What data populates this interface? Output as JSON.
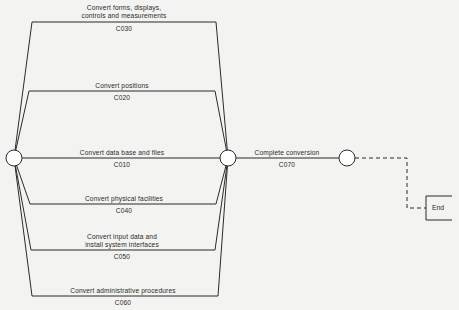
{
  "diagram": {
    "type": "network-activity-diagram",
    "activities": [
      {
        "id": "C030",
        "label_lines": [
          "Convert forms, displays,",
          "controls and measurements"
        ],
        "code": "C030"
      },
      {
        "id": "C020",
        "label_lines": [
          "Convert positions"
        ],
        "code": "C020"
      },
      {
        "id": "C010",
        "label_lines": [
          "Convert data base and files"
        ],
        "code": "C010"
      },
      {
        "id": "C040",
        "label_lines": [
          "Convert physical facilities"
        ],
        "code": "C040"
      },
      {
        "id": "C050",
        "label_lines": [
          "Convert input data and",
          "install system interfaces"
        ],
        "code": "C050"
      },
      {
        "id": "C060",
        "label_lines": [
          "Convert administrative procedures"
        ],
        "code": "C060"
      },
      {
        "id": "C070",
        "label_lines": [
          "Complete conversion"
        ],
        "code": "C070"
      }
    ],
    "end_label": "End",
    "colors": {
      "line": "#2b2b2b",
      "background": "#f3f3f1",
      "node_fill": "#ffffff"
    }
  }
}
